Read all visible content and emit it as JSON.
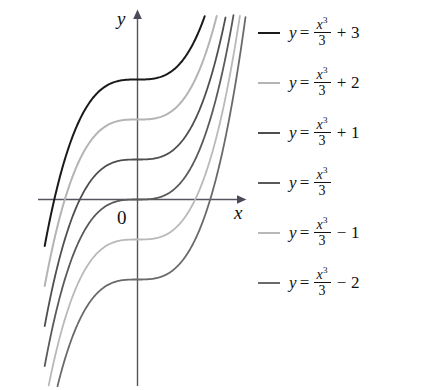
{
  "chart_data": {
    "type": "line",
    "title": "",
    "xlabel": "x",
    "ylabel": "y",
    "axes": {
      "origin_label": "0",
      "x_axis_label": "x",
      "y_axis_label": "y",
      "grid": false,
      "xlim": [
        -2.5,
        2.7
      ],
      "ylim": [
        -4.7,
        4.7
      ],
      "units_per_pixel_y": 0.025,
      "arrowheads": [
        "x-positive",
        "y-positive"
      ]
    },
    "family": "y = x^3/3 + C",
    "legend_position": "right",
    "series": [
      {
        "name": "y = x³/3 + 3",
        "constant": 3,
        "y_intercept": 3,
        "color": "#1a1a1a",
        "width": 2.0,
        "formula_parts": {
          "lhs": "y",
          "eq": "=",
          "num": "x",
          "exp": "3",
          "den": "3",
          "tail": "+ 3"
        }
      },
      {
        "name": "y = x³/3 + 2",
        "constant": 2,
        "y_intercept": 2,
        "color": "#b4b4b4",
        "width": 2.0,
        "formula_parts": {
          "lhs": "y",
          "eq": "=",
          "num": "x",
          "exp": "3",
          "den": "3",
          "tail": "+ 2"
        }
      },
      {
        "name": "y = x³/3 + 1",
        "constant": 1,
        "y_intercept": 1,
        "color": "#4f4f4f",
        "width": 1.8,
        "formula_parts": {
          "lhs": "y",
          "eq": "=",
          "num": "x",
          "exp": "3",
          "den": "3",
          "tail": "+ 1"
        }
      },
      {
        "name": "y = x³/3",
        "constant": 0,
        "y_intercept": 0,
        "color": "#5a5a5a",
        "width": 1.8,
        "formula_parts": {
          "lhs": "y",
          "eq": "=",
          "num": "x",
          "exp": "3",
          "den": "3",
          "tail": ""
        }
      },
      {
        "name": "y = x³/3 − 1",
        "constant": -1,
        "y_intercept": -1,
        "color": "#b9b9b9",
        "width": 1.8,
        "formula_parts": {
          "lhs": "y",
          "eq": "=",
          "num": "x",
          "exp": "3",
          "den": "3",
          "tail": "− 1"
        }
      },
      {
        "name": "y = x³/3 − 2",
        "constant": -2,
        "y_intercept": -2,
        "color": "#6a6a6a",
        "width": 1.8,
        "formula_parts": {
          "lhs": "y",
          "eq": "=",
          "num": "x",
          "exp": "3",
          "den": "3",
          "tail": "− 2"
        }
      }
    ],
    "sample_x": [
      -2.4,
      -2.1,
      -1.8,
      -1.5,
      -1.2,
      -0.9,
      -0.6,
      -0.3,
      0,
      0.3,
      0.6,
      0.9,
      1.2,
      1.5,
      1.8,
      2.1,
      2.4
    ],
    "base_values": [
      -4.608,
      -3.087,
      -1.944,
      -1.125,
      -0.576,
      -0.243,
      -0.072,
      -0.009,
      0,
      0.009,
      0.072,
      0.243,
      0.576,
      1.125,
      1.944,
      3.087,
      4.608
    ]
  },
  "legend": {
    "entries": [
      {
        "label": "y = x³/3 + 3"
      },
      {
        "label": "y = x³/3 + 2"
      },
      {
        "label": "y = x³/3 + 1"
      },
      {
        "label": "y = x³/3"
      },
      {
        "label": "y = x³/3 − 1"
      },
      {
        "label": "y = x³/3 − 2"
      }
    ]
  }
}
